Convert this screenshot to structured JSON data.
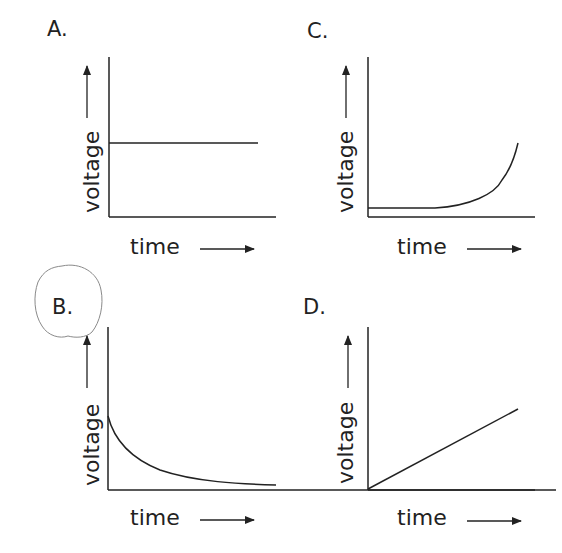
{
  "panels": [
    {
      "id": "A",
      "label": "A.",
      "ylabel": "voltage",
      "xlabel": "time",
      "curve": "constant"
    },
    {
      "id": "B",
      "label": "B.",
      "ylabel": "voltage",
      "xlabel": "time",
      "curve": "exponential-decay",
      "label_circled": true
    },
    {
      "id": "C",
      "label": "C.",
      "ylabel": "voltage",
      "xlabel": "time",
      "curve": "flat-then-exponential-rise"
    },
    {
      "id": "D",
      "label": "D.",
      "ylabel": "voltage",
      "xlabel": "time",
      "curve": "linear-increase"
    }
  ],
  "colors": {
    "ink": "#222222",
    "pencil": "#8a8a8a"
  }
}
